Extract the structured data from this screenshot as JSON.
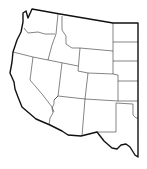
{
  "map": {
    "title": "",
    "type": "blank-outline",
    "region": "Western United States",
    "colors": {
      "background": "#ffffff",
      "fill": "#ffffff",
      "outer_stroke": "#111111",
      "inner_stroke": "#333333"
    },
    "labels": []
  }
}
